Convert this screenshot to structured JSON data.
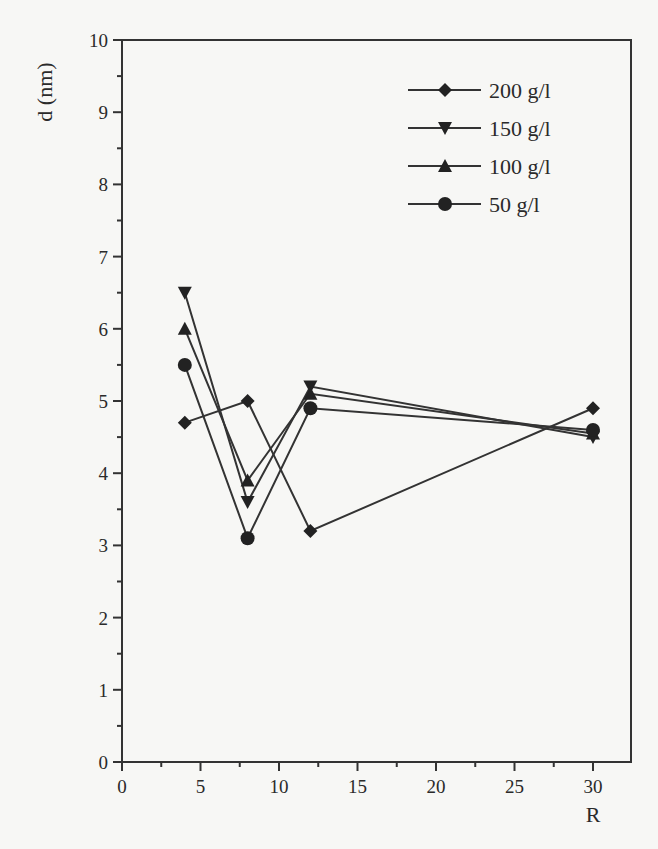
{
  "chart_data": {
    "type": "line",
    "title": "",
    "xlabel": "R",
    "ylabel": "d (nm)",
    "xlim": [
      0,
      32.5
    ],
    "ylim": [
      0,
      10
    ],
    "x_ticks": [
      0,
      5,
      10,
      15,
      20,
      25,
      30
    ],
    "y_ticks": [
      0,
      1,
      2,
      3,
      4,
      5,
      6,
      7,
      8,
      9,
      10
    ],
    "grid": false,
    "legend_position": "upper right",
    "x": [
      4,
      8,
      12,
      30
    ],
    "series": [
      {
        "name": "200 g/l",
        "marker": "diamond",
        "values": [
          4.7,
          5.0,
          3.2,
          4.9
        ]
      },
      {
        "name": "150 g/l",
        "marker": "triangle-down",
        "values": [
          6.5,
          3.6,
          5.2,
          4.5
        ]
      },
      {
        "name": "100 g/l",
        "marker": "triangle-up",
        "values": [
          6.0,
          3.9,
          5.1,
          4.55
        ]
      },
      {
        "name": "50 g/l",
        "marker": "circle",
        "values": [
          5.5,
          3.1,
          4.9,
          4.6
        ]
      }
    ]
  },
  "colors": {
    "line": "#333333",
    "marker": "#222222",
    "background": "#f7f7f5"
  }
}
